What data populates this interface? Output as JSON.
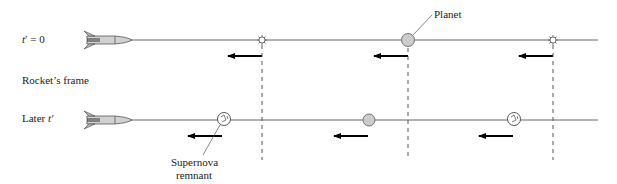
{
  "figure": {
    "row_top": {
      "label_prefix": "t",
      "label_suffix": "′ = 0"
    },
    "frame_label": "Rocket’s frame",
    "row_bottom": {
      "label_prefix": "Later ",
      "label_var": "t′"
    },
    "planet_label": "Planet",
    "remnant_label_line1": "Supernova",
    "remnant_label_line2": "remnant"
  },
  "colors": {
    "line": "#555555",
    "arrow": "#000000",
    "planet_fill": "#cccccc",
    "rocket_fill": "#cfcfcf"
  }
}
